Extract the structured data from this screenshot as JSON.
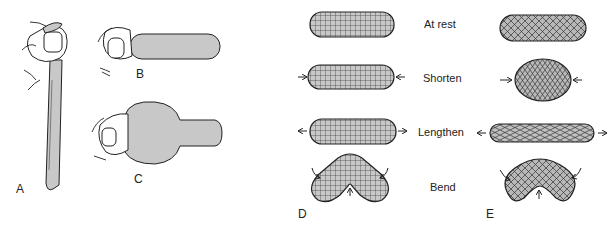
{
  "panels": {
    "A": {
      "label": "A"
    },
    "B": {
      "label": "B"
    },
    "C": {
      "label": "C"
    },
    "D": {
      "label": "D",
      "pattern": "orthogonal grid (longitudinal + circular fibers)"
    },
    "E": {
      "label": "E",
      "pattern": "crossed helical fibers"
    }
  },
  "rows": [
    {
      "label": "At rest"
    },
    {
      "label": "Shorten"
    },
    {
      "label": "Lengthen"
    },
    {
      "label": "Bend"
    }
  ],
  "colors": {
    "fill": "#c8c8c8",
    "stroke": "#222222",
    "background": "#ffffff"
  }
}
